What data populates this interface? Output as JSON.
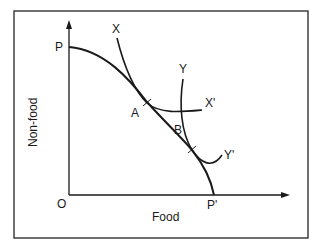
{
  "diagram": {
    "type": "production-possibility-frontier",
    "axes": {
      "y_label": "Non-food",
      "x_label": "Food",
      "origin_label": "O"
    },
    "frontier": {
      "start_label": "P",
      "end_label": "P'"
    },
    "curves": [
      {
        "start_label": "X",
        "end_label": "X'",
        "tangent_point": "A"
      },
      {
        "start_label": "Y",
        "end_label": "Y'",
        "tangent_point": "B"
      }
    ],
    "points": {
      "a": "A",
      "b": "B"
    },
    "colors": {
      "line": "#1a1a1a",
      "background": "#ffffff"
    }
  }
}
